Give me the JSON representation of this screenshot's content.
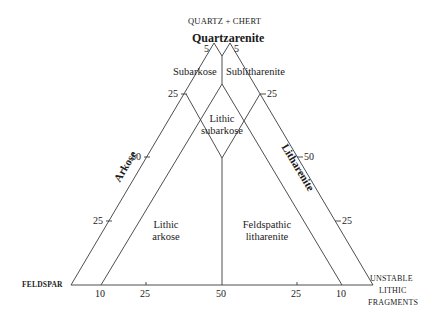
{
  "diagram": {
    "type": "ternary-sandstone-classification",
    "vertices": {
      "top": "QUARTZ + CHERT",
      "left": "FELDSPAR",
      "right_line1": "UNSTABLE",
      "right_line2": "LITHIC",
      "right_line3": "FRAGMENTS"
    },
    "fields": {
      "quartzarenite": "Quartzarenite",
      "subarkose": "Subarkose",
      "sublitharenite": "Sublitharenite",
      "lithic_subarkose_1": "Lithic",
      "lithic_subarkose_2": "subarkose",
      "arkose": "Arkose",
      "litharenite": "Litharenite",
      "lithic_arkose_1": "Lithic",
      "lithic_arkose_2": "arkose",
      "feldspathic_litharenite_1": "Feldspathic",
      "feldspathic_litharenite_2": "litharenite"
    },
    "ticks": {
      "left_top_5": "5",
      "right_top_5": "5",
      "left_25_upper": "25",
      "right_25_upper": "25",
      "left_50": "50",
      "right_50": "50",
      "left_25_lower": "25",
      "right_25_lower": "25",
      "base": [
        "10",
        "25",
        "50",
        "25",
        "10"
      ]
    },
    "line_color": "#3a3a3a"
  }
}
